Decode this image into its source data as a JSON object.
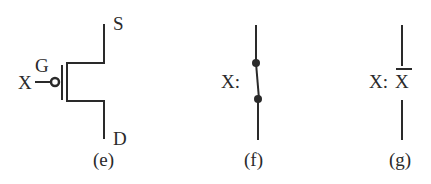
{
  "diagram": {
    "panels": [
      {
        "id": "e",
        "caption": "(e)",
        "type": "pmos-transistor",
        "labels": {
          "input": "X",
          "gate": "G",
          "source": "S",
          "drain": "D"
        }
      },
      {
        "id": "f",
        "caption": "(f)",
        "type": "closed-switch",
        "labels": {
          "input": "X:"
        }
      },
      {
        "id": "g",
        "caption": "(g)",
        "type": "open-switch-complement",
        "labels": {
          "input": "X:",
          "complement": "X"
        }
      }
    ],
    "colors": {
      "stroke": "#2a2a2a",
      "background": "#ffffff"
    }
  }
}
